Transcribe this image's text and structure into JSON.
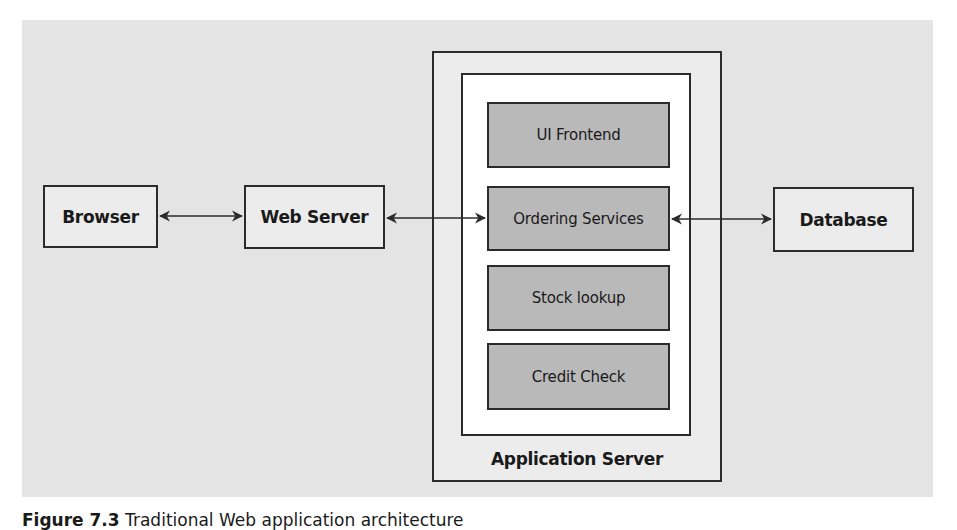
{
  "diagram": {
    "title": "Traditional Web application architecture",
    "nodes": {
      "browser": {
        "label": "Browser"
      },
      "web_server": {
        "label": "Web Server"
      },
      "database": {
        "label": "Database"
      },
      "application_server": {
        "label": "Application Server",
        "services": [
          {
            "label": "UI Frontend"
          },
          {
            "label": "Ordering Services"
          },
          {
            "label": "Stock lookup"
          },
          {
            "label": "Credit Check"
          }
        ]
      }
    },
    "edges": [
      {
        "from": "Browser",
        "to": "Web Server",
        "type": "bidirectional"
      },
      {
        "from": "Web Server",
        "to": "Ordering Services",
        "type": "bidirectional"
      },
      {
        "from": "Ordering Services",
        "to": "Database",
        "type": "bidirectional"
      }
    ],
    "colors": {
      "panel_bg": "#e4e4e4",
      "box_light": "#ececec",
      "box_service": "#b9b9b9",
      "inner_bg": "#ffffff",
      "stroke": "#2b2b2b"
    }
  },
  "caption": {
    "figure_label": "Figure 7.3",
    "text": "Traditional Web application architecture"
  }
}
